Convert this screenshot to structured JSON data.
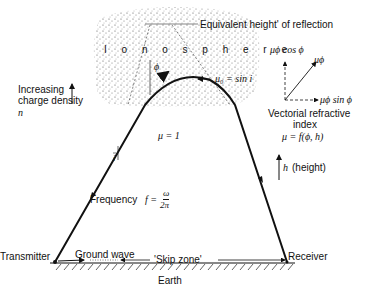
{
  "labels": {
    "ionosphere": "I o n o s p h e r e",
    "equivalent_height": "Equivalent height' of reflection",
    "mu0_sin_i": "μ₀ = sin i",
    "phi": "ϕ",
    "mu_phi_cos_phi": "μϕ cos ϕ",
    "mu_phi": "μϕ",
    "mu_phi_sin_phi": "μϕ sin ϕ",
    "vectorial_line1": "Vectorial refractive",
    "vectorial_line2": "index",
    "mu_function": "μ = f(ϕ, h)",
    "increasing_line1": "Increasing",
    "increasing_line2": "charge density",
    "increasing_n": "n",
    "mu_equals_1": "μ = 1",
    "incidence_angle": "i",
    "frequency_prefix": "Frequency",
    "frequency_f": "f =",
    "frequency_num": "ω",
    "frequency_den": "2π",
    "height_h": "h",
    "height_text": "(height)",
    "transmitter": "Transmitter",
    "ground_wave": "Ground wave",
    "skip_zone": "'Skip zone'",
    "receiver": "Receiver",
    "earth": "Earth"
  },
  "colors": {
    "ink": "#111111",
    "stipple": "#555555",
    "background": "#ffffff"
  }
}
